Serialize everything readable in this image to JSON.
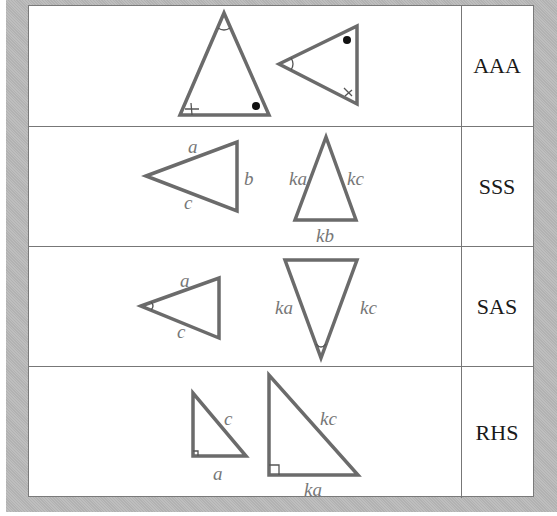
{
  "table": {
    "rows": [
      {
        "id": "aaa",
        "label": "AAA",
        "description": "Two triangles with three equal corresponding angles",
        "side_labels": {}
      },
      {
        "id": "sss",
        "label": "SSS",
        "side_labels": {
          "t1_top": "a",
          "t1_right": "b",
          "t1_bottom": "c",
          "t2_left": "ka",
          "t2_right": "kc",
          "t2_bottom": "kb"
        }
      },
      {
        "id": "sas",
        "label": "SAS",
        "side_labels": {
          "t1_top": "a",
          "t1_bottom": "c",
          "t2_left": "ka",
          "t2_right": "kc"
        }
      },
      {
        "id": "rhs",
        "label": "RHS",
        "side_labels": {
          "t1_hyp": "c",
          "t1_bottom": "a",
          "t2_hyp": "kc",
          "t2_bottom": "ka"
        }
      }
    ]
  },
  "colors": {
    "frame": "#b9b9b9",
    "triangle_stroke": "#6b6b6b",
    "label_text": "#777777",
    "rule_text": "#1a1a1a"
  }
}
